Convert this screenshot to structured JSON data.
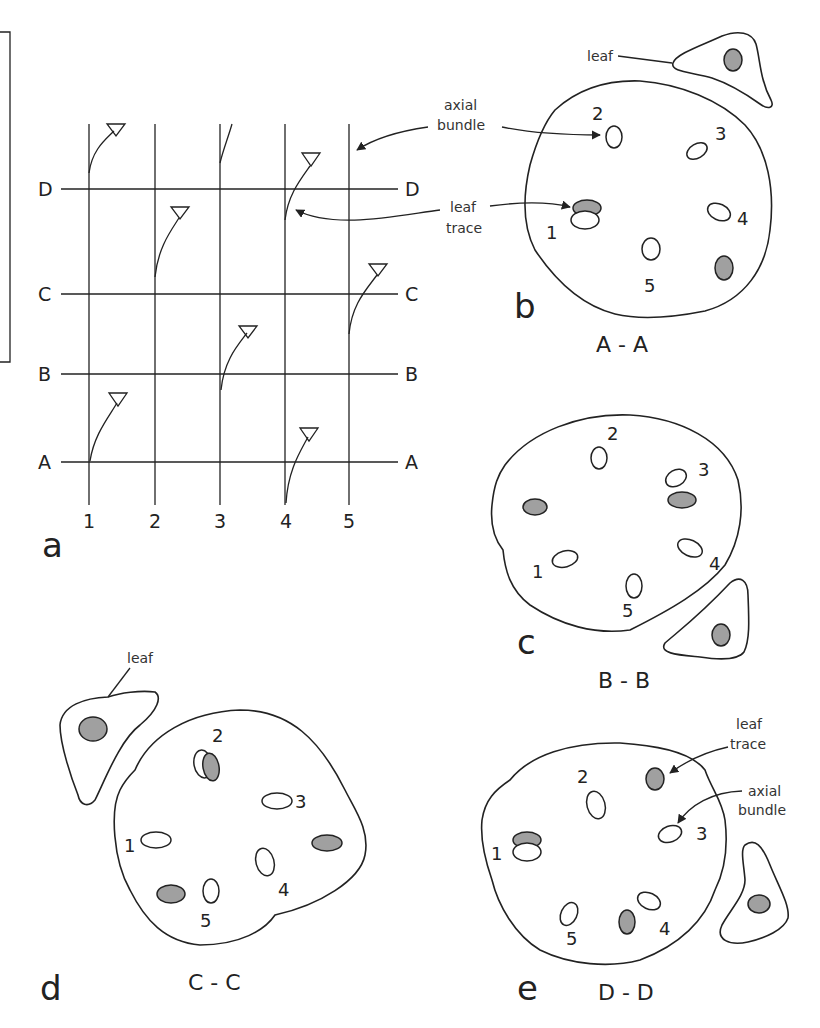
{
  "figure": {
    "frame_note": "partial rectangular frame at upper-left edge",
    "colors": {
      "line": "#222222",
      "leaf_trace_fill": "#a0a0a0",
      "background": "#ffffff"
    }
  },
  "panel_a": {
    "letter": "a",
    "columns": [
      "1",
      "2",
      "3",
      "4",
      "5"
    ],
    "rows": [
      "D",
      "C",
      "B",
      "A"
    ],
    "row_labels_right": [
      "D",
      "C",
      "B",
      "A"
    ],
    "annotations": {
      "axial_bundle": "axial bundle",
      "leaf_trace": "leaf trace"
    }
  },
  "panel_b": {
    "letter": "b",
    "section": "A - A",
    "leaf_label": "leaf",
    "annotations": {
      "axial_bundle_l1": "axial",
      "axial_bundle_l2": "bundle",
      "leaf_trace_l1": "leaf",
      "leaf_trace_l2": "trace"
    },
    "bundles": [
      "1",
      "2",
      "3",
      "4",
      "5"
    ]
  },
  "panel_c": {
    "letter": "c",
    "section": "B - B",
    "bundles": [
      "1",
      "2",
      "3",
      "4",
      "5"
    ]
  },
  "panel_d": {
    "letter": "d",
    "section": "C - C",
    "leaf_label": "leaf",
    "bundles": [
      "1",
      "2",
      "3",
      "4",
      "5"
    ]
  },
  "panel_e": {
    "letter": "e",
    "section": "D - D",
    "annotations": {
      "leaf_trace_l1": "leaf",
      "leaf_trace_l2": "trace",
      "axial_bundle_l1": "axial",
      "axial_bundle_l2": "bundle"
    },
    "bundles": [
      "1",
      "2",
      "3",
      "4",
      "5"
    ]
  }
}
